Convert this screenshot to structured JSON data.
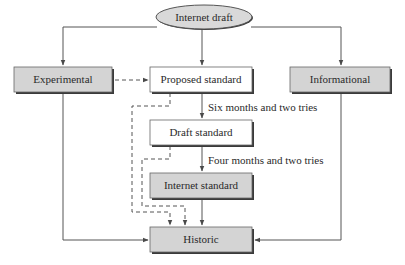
{
  "diagram": {
    "nodes": {
      "internet_draft": "Internet draft",
      "experimental": "Experimental",
      "proposed_standard": "Proposed standard",
      "informational": "Informational",
      "draft_standard": "Draft standard",
      "internet_standard": "Internet standard",
      "historic": "Historic"
    },
    "edge_labels": {
      "proposed_to_draft": "Six months and two tries",
      "draft_to_internet": "Four months and two tries"
    },
    "edges": [
      {
        "from": "Internet draft",
        "to": "Experimental",
        "style": "solid"
      },
      {
        "from": "Internet draft",
        "to": "Proposed standard",
        "style": "solid"
      },
      {
        "from": "Internet draft",
        "to": "Informational",
        "style": "solid"
      },
      {
        "from": "Experimental",
        "to": "Proposed standard",
        "style": "dashed"
      },
      {
        "from": "Proposed standard",
        "to": "Draft standard",
        "style": "solid",
        "label": "Six months and two tries"
      },
      {
        "from": "Draft standard",
        "to": "Internet standard",
        "style": "solid",
        "label": "Four months and two tries"
      },
      {
        "from": "Internet standard",
        "to": "Historic",
        "style": "solid"
      },
      {
        "from": "Proposed standard",
        "to": "Historic",
        "style": "dashed"
      },
      {
        "from": "Draft standard",
        "to": "Historic",
        "style": "dashed"
      },
      {
        "from": "Experimental",
        "to": "Historic",
        "style": "solid"
      },
      {
        "from": "Informational",
        "to": "Historic",
        "style": "solid"
      }
    ],
    "colors": {
      "gray_fill": "#d4d4d4",
      "white_fill": "#ffffff",
      "ellipse_fill": "#d9d9d9",
      "line": "#4a4a4a",
      "shadow": "#3a3a3a"
    }
  }
}
